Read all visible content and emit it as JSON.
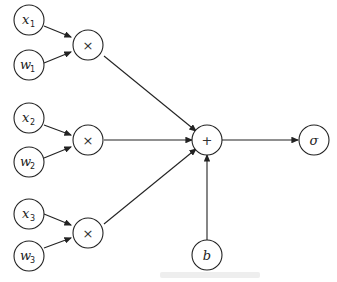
{
  "diagram": {
    "type": "perceptron",
    "inputs": [
      {
        "x_label": "x",
        "x_sub": "1",
        "w_label": "w",
        "w_sub": "1"
      },
      {
        "x_label": "x",
        "x_sub": "2",
        "w_label": "w",
        "w_sub": "2"
      },
      {
        "x_label": "x",
        "x_sub": "3",
        "w_label": "w",
        "w_sub": "3"
      }
    ],
    "multiply_symbol": "×",
    "sum_symbol": "+",
    "bias_label": "b",
    "activation_label": "σ"
  }
}
